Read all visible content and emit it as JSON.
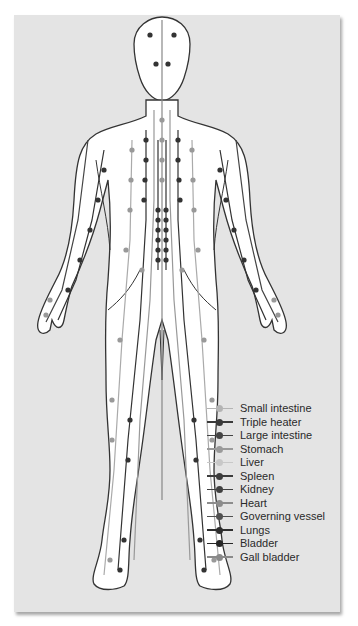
{
  "figure": {
    "title": ""
  },
  "legend": {
    "items": [
      {
        "label": "Small intestine",
        "color": "#b4b4b4"
      },
      {
        "label": "Triple heater",
        "color": "#3a3a3a"
      },
      {
        "label": "Large intestine",
        "color": "#444444"
      },
      {
        "label": "Stomach",
        "color": "#9a9a9a"
      },
      {
        "label": "Liver",
        "color": "#c8c8c8"
      },
      {
        "label": "Spleen",
        "color": "#3c3c3c"
      },
      {
        "label": "Kidney",
        "color": "#404040"
      },
      {
        "label": "Heart",
        "color": "#8c8c8c"
      },
      {
        "label": "Governing vessel",
        "color": "#505050"
      },
      {
        "label": "Lungs",
        "color": "#2e2e2e"
      },
      {
        "label": "Bladder",
        "color": "#262626"
      },
      {
        "label": "Gall bladder",
        "color": "#8a8a8a"
      }
    ]
  },
  "colors": {
    "panel_bg": "#e4e4e4",
    "body_fill": "#ffffff",
    "outline": "#333333"
  }
}
